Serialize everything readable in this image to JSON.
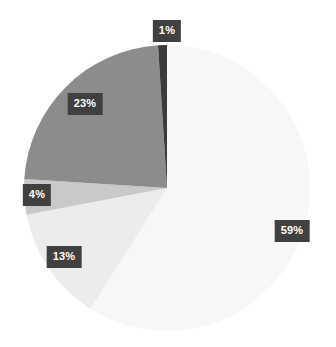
{
  "chart_data": {
    "type": "pie",
    "title": "",
    "subtitle": "",
    "xlabel": "",
    "ylabel": "",
    "legend": "none",
    "grid": false,
    "start_angle_deg": 0,
    "direction": "clockwise",
    "center": {
      "x": 167,
      "y": 188
    },
    "radius": 143,
    "labels_show_percent": true,
    "categories": [
      "59%",
      "13%",
      "4%",
      "23%",
      "1%"
    ],
    "values": [
      59,
      13,
      4,
      23,
      1
    ],
    "slices": [
      {
        "label": "59%",
        "value": 59,
        "color": "#f7f7f7",
        "start_deg": 0,
        "end_deg": 212.4,
        "label_x": 292,
        "label_y": 231
      },
      {
        "label": "13%",
        "value": 13,
        "color": "#ececec",
        "start_deg": 212.4,
        "end_deg": 259.2,
        "label_x": 64,
        "label_y": 257
      },
      {
        "label": "4%",
        "value": 4,
        "color": "#c9c9c9",
        "start_deg": 259.2,
        "end_deg": 273.6,
        "label_x": 37,
        "label_y": 195
      },
      {
        "label": "23%",
        "value": 23,
        "color": "#8c8c8c",
        "start_deg": 273.6,
        "end_deg": 356.4,
        "label_x": 85,
        "label_y": 104
      },
      {
        "label": "1%",
        "value": 1,
        "color": "#3b3b3b",
        "start_deg": 356.4,
        "end_deg": 360,
        "label_x": 167,
        "label_y": 31
      }
    ],
    "colors": {
      "background": "#ffffff",
      "label_box": "#404040",
      "label_text": "#ffffff"
    }
  }
}
